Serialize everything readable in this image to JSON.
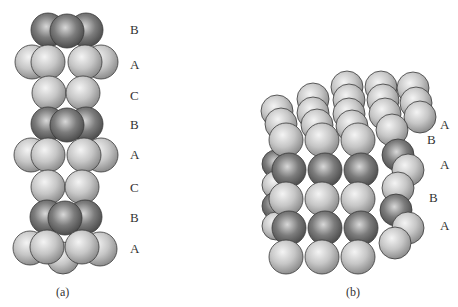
{
  "figure_a": {
    "caption": "(a)",
    "layers": [
      {
        "label": "B",
        "shade": "dark"
      },
      {
        "label": "A",
        "shade": "light"
      },
      {
        "label": "C",
        "shade": "light"
      },
      {
        "label": "B",
        "shade": "dark"
      },
      {
        "label": "A",
        "shade": "light"
      },
      {
        "label": "C",
        "shade": "light"
      },
      {
        "label": "B",
        "shade": "dark"
      },
      {
        "label": "A",
        "shade": "light"
      }
    ]
  },
  "figure_b": {
    "caption": "(b)",
    "layers": [
      {
        "label": "A",
        "shade": "light"
      },
      {
        "label": "B",
        "shade": "dark"
      },
      {
        "label": "A",
        "shade": "light"
      },
      {
        "label": "B",
        "shade": "dark"
      },
      {
        "label": "A",
        "shade": "light"
      }
    ]
  },
  "colors": {
    "light_sphere": "#c8c8c8",
    "dark_sphere": "#7a7a7a",
    "outline": "#3a3a3a",
    "background": "#ffffff"
  }
}
